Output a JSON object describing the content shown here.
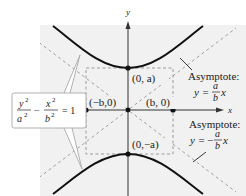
{
  "diagram": {
    "colors": {
      "background": "#ffffff",
      "shaded_region": "#f0f0f0",
      "curve": "#111111",
      "asymptote": "#a0a0a0",
      "guide_rect": "#9a9a9a",
      "axis": "#333333",
      "callout_border": "#a8a8a8"
    },
    "axes": {
      "x_label": "x",
      "y_label": "y"
    },
    "equation": {
      "term1_num": "y",
      "term1_num_exp": "2",
      "term1_den": "a",
      "term1_den_exp": "2",
      "minus": "−",
      "term2_num": "x",
      "term2_num_exp": "2",
      "term2_den": "b",
      "term2_den_exp": "2",
      "equals": "= 1"
    },
    "points": [
      {
        "id": "upper-vertex",
        "label": "(0, a)"
      },
      {
        "id": "lower-vertex",
        "label": "(0,−a)"
      },
      {
        "id": "left-co-vertex",
        "label": "(−b,0)"
      },
      {
        "id": "right-co-vertex",
        "label": "(b, 0)"
      }
    ],
    "asymptotes": [
      {
        "id": "positive",
        "title": "Asymptote:",
        "lhs": "y =",
        "sign": "",
        "num": "a",
        "den": "b",
        "var": "x"
      },
      {
        "id": "negative",
        "title": "Asymptote:",
        "lhs": "y =",
        "sign": "−",
        "num": "a",
        "den": "b",
        "var": "x"
      }
    ]
  }
}
